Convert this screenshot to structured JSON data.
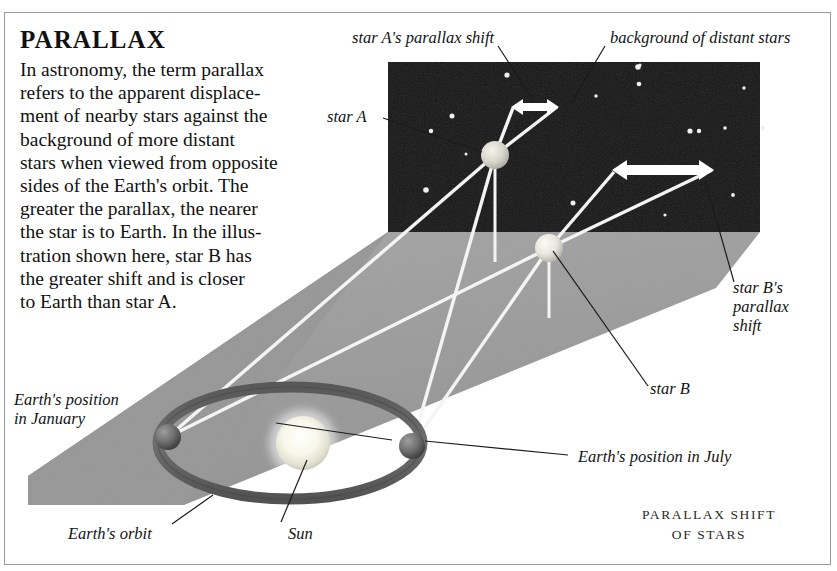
{
  "article": {
    "title": "PARALLAX",
    "body": "In astronomy, the term parallax\nrefers to the apparent displace-\nment of nearby stars against the\nbackground of more distant\nstars when viewed from opposite\nsides of the Earth's orbit. The\ngreater the parallax, the nearer\nthe star is to Earth. In the illus-\ntration shown here, star B has\nthe greater shift and is closer\nto Earth than star A."
  },
  "labels": {
    "star_a_shift": "star A's parallax shift",
    "background_stars": "background of distant stars",
    "star_a": "star A",
    "star_b_shift": "star B's\nparallax\nshift",
    "star_b": "star B",
    "earth_january": "Earth's position\nin January",
    "earth_july": "Earth's position in July",
    "earth_orbit": "Earth's orbit",
    "sun": "Sun"
  },
  "caption": "PARALLAX SHIFT\nOF STARS",
  "colors": {
    "page_background": "#ffffff",
    "frame_border": "#9a9a9a",
    "sky_field": "#141414",
    "ground_plane": "#9e9e9e",
    "ground_plane_left": "#8f8f8f",
    "orbit_ring": "#6a6a6a",
    "sun_glow": "#fdfdf2",
    "earth_sphere": "#6d6d6d",
    "star_a_body": "#d8d8d0",
    "star_b_body": "#e8e8e0",
    "sight_line": "#f2f2f2",
    "arrow_white": "#ffffff",
    "leader_line": "#1a1a1a",
    "text": "#111111"
  },
  "scene": {
    "sky_rect": {
      "x": 388,
      "y": 62,
      "width": 372,
      "height": 170
    },
    "star_a": {
      "cx": 495,
      "cy": 155,
      "r": 13
    },
    "star_b": {
      "cx": 549,
      "cy": 248,
      "r": 13
    },
    "sun": {
      "cx": 303,
      "cy": 443,
      "r": 28
    },
    "earth_january": {
      "cx": 168,
      "cy": 437,
      "r": 12
    },
    "earth_july": {
      "cx": 412,
      "cy": 446,
      "r": 12
    },
    "orbit": {
      "cx": 290,
      "cy": 443,
      "rx": 132,
      "ry": 56
    },
    "arrow_star_a": {
      "x1": 512,
      "y1": 107,
      "x2": 557,
      "y2": 107
    },
    "arrow_star_b": {
      "x1": 613,
      "y1": 170,
      "x2": 712,
      "y2": 170
    },
    "background_star_count": 17
  }
}
